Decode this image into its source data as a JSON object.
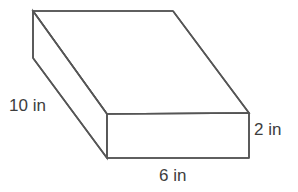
{
  "figure": {
    "name": "rectangular-prism-diagram",
    "shape": "rectangular prism",
    "stroke_color": "#555555",
    "fill_color": "#ffffff",
    "background_color": "#ffffff",
    "text_color": "#3d3d3d",
    "labels": {
      "depth": "10 in",
      "width": "6 in",
      "height": "2 in"
    },
    "dimensions": {
      "depth_value": 10,
      "width_value": 6,
      "height_value": 2,
      "unit": "in"
    },
    "vertices": {
      "top_back_left": "33,11",
      "top_back_right": "173,11",
      "top_front_right": "249,113",
      "top_front_left": "107,114",
      "bottom_front_left": "107,158",
      "bottom_front_right": "249,158",
      "bottom_back_left": "33,58"
    }
  }
}
